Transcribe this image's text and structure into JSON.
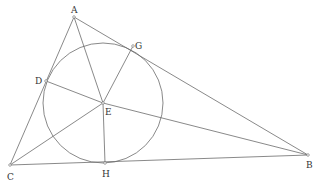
{
  "diagram": {
    "type": "geometry",
    "colors": {
      "line": "#6b6b6b",
      "label": "#333333",
      "background": "#ffffff"
    },
    "points": [
      {
        "id": "A",
        "label": "A",
        "x": 74,
        "y": 17,
        "lx": 71,
        "ly": 13
      },
      {
        "id": "B",
        "label": "B",
        "x": 308,
        "y": 155,
        "lx": 306,
        "ly": 168
      },
      {
        "id": "C",
        "label": "C",
        "x": 10,
        "y": 165,
        "lx": 7,
        "ly": 180
      },
      {
        "id": "D",
        "label": "D",
        "x": 46,
        "y": 81,
        "lx": 35,
        "ly": 84
      },
      {
        "id": "E",
        "label": "E",
        "x": 103,
        "y": 103,
        "lx": 105,
        "ly": 115
      },
      {
        "id": "G",
        "label": "G",
        "x": 133,
        "y": 46,
        "lx": 135,
        "ly": 49
      },
      {
        "id": "H",
        "label": "H",
        "x": 105,
        "y": 163,
        "lx": 102,
        "ly": 177
      }
    ],
    "segments": [
      [
        "A",
        "B"
      ],
      [
        "B",
        "C"
      ],
      [
        "C",
        "A"
      ],
      [
        "A",
        "E"
      ],
      [
        "B",
        "E"
      ],
      [
        "C",
        "E"
      ],
      [
        "D",
        "E"
      ],
      [
        "G",
        "E"
      ],
      [
        "H",
        "E"
      ]
    ],
    "circle": {
      "center": "E",
      "cx": 103,
      "cy": 103,
      "r": 60
    }
  }
}
